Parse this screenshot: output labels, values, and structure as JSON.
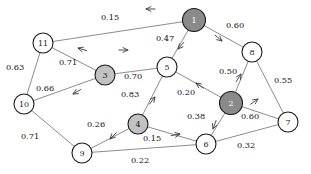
{
  "diagram": {
    "type": "node-link-graph",
    "canvas": {
      "width": 311,
      "height": 174,
      "background": "#ffffff"
    },
    "colors": {
      "node_white": "#ffffff",
      "node_light_gray": "#c2c2c2",
      "node_dark_gray": "#8a8a8a",
      "node_stroke": "#1a1a1a",
      "edge": "#6e6e6e",
      "label_text": "#111111",
      "dark_node_text": "#ffffff"
    },
    "nodes": [
      {
        "id": "1",
        "label": "1",
        "x": 194,
        "y": 20,
        "r": 11.5,
        "shade": "dark",
        "text_class": "light"
      },
      {
        "id": "2",
        "label": "2",
        "x": 231,
        "y": 103,
        "r": 11.5,
        "shade": "dark",
        "text_class": "light"
      },
      {
        "id": "3",
        "label": "3",
        "x": 105,
        "y": 75,
        "r": 10.0,
        "shade": "light",
        "text_class": "dark"
      },
      {
        "id": "4",
        "label": "4",
        "x": 138,
        "y": 124,
        "r": 10.0,
        "shade": "light",
        "text_class": "dark"
      },
      {
        "id": "5",
        "label": "5",
        "x": 167,
        "y": 67,
        "r": 10.0,
        "shade": "white",
        "text_class": "dark"
      },
      {
        "id": "6",
        "label": "6",
        "x": 206,
        "y": 144,
        "r": 10.0,
        "shade": "white",
        "text_class": "dark"
      },
      {
        "id": "7",
        "label": "7",
        "x": 288,
        "y": 122,
        "r": 10.0,
        "shade": "white",
        "text_class": "dark"
      },
      {
        "id": "8",
        "label": "8",
        "x": 252,
        "y": 52,
        "r": 10.0,
        "shade": "white",
        "text_class": "dark"
      },
      {
        "id": "9",
        "label": "9",
        "x": 82,
        "y": 153,
        "r": 10.0,
        "shade": "white",
        "text_class": "dark"
      },
      {
        "id": "10",
        "label": "10",
        "x": 24,
        "y": 104,
        "r": 10.0,
        "shade": "white",
        "text_class": "dark"
      },
      {
        "id": "11",
        "label": "11",
        "x": 43,
        "y": 43,
        "r": 10.0,
        "shade": "white",
        "text_class": "dark"
      }
    ],
    "edges": [
      {
        "from": "1",
        "to": "11",
        "weight": "0.15",
        "label_x": 110,
        "label_y": 17,
        "directed": true,
        "arrow_x": 146,
        "arrow_y": 9,
        "arrow_angle": 180
      },
      {
        "from": "1",
        "to": "8",
        "weight": "0.60",
        "label_x": 235,
        "label_y": 25,
        "directed": true,
        "arrow_x": 222,
        "arrow_y": 41,
        "arrow_angle": 40
      },
      {
        "from": "1",
        "to": "5",
        "weight": "0.47",
        "label_x": 165,
        "label_y": 38,
        "directed": true,
        "arrow_x": 178,
        "arrow_y": 49,
        "arrow_angle": 131
      },
      {
        "from": "3",
        "to": "11",
        "weight": "0.71",
        "label_x": 68,
        "label_y": 62,
        "directed": true,
        "arrow_x": 78,
        "arrow_y": 48,
        "arrow_angle": 197
      },
      {
        "from": "11",
        "to": "10",
        "weight": "0.63",
        "label_x": 15,
        "label_y": 67,
        "directed": false,
        "arrow_x": 0,
        "arrow_y": 0,
        "arrow_angle": 0
      },
      {
        "from": "3",
        "to": "10",
        "weight": "0.66",
        "label_x": 45,
        "label_y": 88,
        "directed": true,
        "arrow_x": 73,
        "arrow_y": 94,
        "arrow_angle": 150
      },
      {
        "from": "3",
        "to": "5",
        "weight": "0.70",
        "label_x": 133,
        "label_y": 76,
        "directed": true,
        "arrow_x": 128,
        "arrow_y": 50,
        "arrow_angle": 0
      },
      {
        "from": "10",
        "to": "9",
        "weight": "0.71",
        "label_x": 30,
        "label_y": 136,
        "directed": false,
        "arrow_x": 0,
        "arrow_y": 0,
        "arrow_angle": 0
      },
      {
        "from": "4",
        "to": "5",
        "weight": "0.83",
        "label_x": 130,
        "label_y": 94,
        "directed": true,
        "arrow_x": 155,
        "arrow_y": 97,
        "arrow_angle": -52
      },
      {
        "from": "4",
        "to": "9",
        "weight": "0.26",
        "label_x": 96,
        "label_y": 124,
        "directed": true,
        "arrow_x": 110,
        "arrow_y": 139,
        "arrow_angle": 135
      },
      {
        "from": "4",
        "to": "6",
        "weight": "0.15",
        "label_x": 152,
        "label_y": 138,
        "directed": true,
        "arrow_x": 180,
        "arrow_y": 134,
        "arrow_angle": -10
      },
      {
        "from": "9",
        "to": "6",
        "weight": "0.22",
        "label_x": 140,
        "label_y": 160,
        "directed": false,
        "arrow_x": 0,
        "arrow_y": 0,
        "arrow_angle": 0
      },
      {
        "from": "2",
        "to": "5",
        "weight": "0.20",
        "label_x": 186,
        "label_y": 92,
        "directed": true,
        "arrow_x": 196,
        "arrow_y": 83,
        "arrow_angle": 215
      },
      {
        "from": "2",
        "to": "8",
        "weight": "0.50",
        "label_x": 228,
        "label_y": 71,
        "directed": true,
        "arrow_x": 241,
        "arrow_y": 74,
        "arrow_angle": -58
      },
      {
        "from": "2",
        "to": "6",
        "weight": "0.38",
        "label_x": 196,
        "label_y": 116,
        "directed": true,
        "arrow_x": 213,
        "arrow_y": 129,
        "arrow_angle": 110
      },
      {
        "from": "2",
        "to": "7",
        "weight": "0.60",
        "label_x": 250,
        "label_y": 116,
        "directed": true,
        "arrow_x": 258,
        "arrow_y": 99,
        "arrow_angle": -35
      },
      {
        "from": "8",
        "to": "7",
        "weight": "0.55",
        "label_x": 283,
        "label_y": 80,
        "directed": false,
        "arrow_x": 0,
        "arrow_y": 0,
        "arrow_angle": 0
      },
      {
        "from": "6",
        "to": "7",
        "weight": "0.32",
        "label_x": 246,
        "label_y": 145,
        "directed": false,
        "arrow_x": 0,
        "arrow_y": 0,
        "arrow_angle": 0
      }
    ]
  }
}
